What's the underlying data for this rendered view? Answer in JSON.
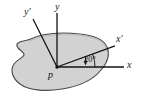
{
  "figure": {
    "type": "engineering-diagram",
    "colors": {
      "body_fill": "#d2d2d2",
      "body_outline": "#4a4a4a",
      "axis_line": "#111111",
      "background": "#ffffff",
      "text": "#111111"
    },
    "body": {
      "name": "rigid-body-blob",
      "fill": "#d2d2d2",
      "stroke": "#4a4a4a"
    },
    "origin": {
      "label": "p",
      "x": 57,
      "y": 67
    },
    "axes": [
      {
        "id": "y-axis",
        "label": "y",
        "system": "original",
        "direction": "vertical-up",
        "angle_deg": 90,
        "x1": 57,
        "y1": 67,
        "x2": 57,
        "y2": 13
      },
      {
        "id": "y-prime-axis",
        "label": "y′",
        "system": "rotated",
        "direction": "up-left",
        "angle_deg": 110,
        "x1": 57,
        "y1": 67,
        "x2": 33,
        "y2": 19
      },
      {
        "id": "x-axis",
        "label": "x",
        "system": "original",
        "direction": "horizontal-right",
        "angle_deg": 0,
        "x1": 57,
        "y1": 67,
        "x2": 124,
        "y2": 67
      },
      {
        "id": "x-prime-axis",
        "label": "x′",
        "system": "rotated",
        "direction": "up-right",
        "angle_deg": 20,
        "x1": 57,
        "y1": 67,
        "x2": 115,
        "y2": 45
      }
    ],
    "angle_annotation": {
      "value": "20",
      "unit": "°",
      "text": "20°",
      "between": [
        "x-axis",
        "x-prime-axis"
      ],
      "arc_radius": 38,
      "leader": "down-arrow"
    }
  }
}
